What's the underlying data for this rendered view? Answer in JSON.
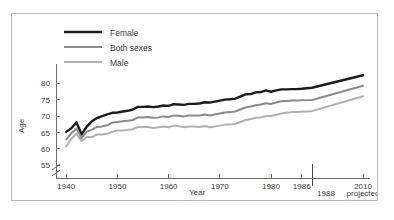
{
  "chart_data": {
    "type": "line",
    "title": "",
    "xlabel": "Year",
    "ylabel": "Age",
    "xlim": [
      1938,
      2013
    ],
    "ylim": [
      53,
      84
    ],
    "grid": false,
    "legend_position": "top-left",
    "y_ticks": [
      55,
      60,
      65,
      70,
      75,
      80
    ],
    "x_ticks": [
      1940,
      1950,
      1960,
      1970,
      1980,
      1986,
      2010
    ],
    "x_tick_labels": [
      "1940",
      "1950",
      "1960",
      "1970",
      "1980",
      "1986",
      "2010"
    ],
    "axis_break": true,
    "axis_break_note": "y-axis broken below 55",
    "annotations": [
      {
        "text": "1988",
        "x": 1988,
        "role": "projection-divider-label"
      },
      {
        "text": "projected",
        "x": 2010,
        "role": "projection-note"
      }
    ],
    "divider_x": 1988,
    "series": [
      {
        "name": "Female",
        "color": "#1c1c1c",
        "width": 2.4,
        "x": [
          1940,
          1941,
          1942,
          1943,
          1944,
          1945,
          1946,
          1947,
          1948,
          1949,
          1950,
          1951,
          1952,
          1953,
          1954,
          1955,
          1956,
          1957,
          1958,
          1959,
          1960,
          1961,
          1962,
          1963,
          1964,
          1965,
          1966,
          1967,
          1968,
          1969,
          1970,
          1971,
          1972,
          1973,
          1974,
          1975,
          1976,
          1977,
          1978,
          1979,
          1980,
          1981,
          1982,
          1983,
          1984,
          1985,
          1986,
          1988,
          2010
        ],
        "values": [
          65.2,
          66.3,
          68.1,
          64.4,
          66.8,
          68.4,
          69.4,
          70.0,
          70.5,
          71.0,
          71.1,
          71.4,
          71.6,
          72.0,
          72.8,
          72.8,
          72.9,
          72.7,
          72.9,
          73.2,
          73.1,
          73.6,
          73.5,
          73.4,
          73.7,
          73.7,
          73.8,
          74.2,
          74.1,
          74.4,
          74.7,
          75.0,
          75.1,
          75.3,
          75.9,
          76.6,
          76.7,
          77.2,
          77.3,
          77.8,
          77.4,
          77.8,
          78.1,
          78.1,
          78.2,
          78.2,
          78.3,
          78.6,
          82.4
        ]
      },
      {
        "name": "Both sexes",
        "color": "#8a8a8a",
        "width": 2.0,
        "x": [
          1940,
          1941,
          1942,
          1943,
          1944,
          1945,
          1946,
          1947,
          1948,
          1949,
          1950,
          1951,
          1952,
          1953,
          1954,
          1955,
          1956,
          1957,
          1958,
          1959,
          1960,
          1961,
          1962,
          1963,
          1964,
          1965,
          1966,
          1967,
          1968,
          1969,
          1970,
          1971,
          1972,
          1973,
          1974,
          1975,
          1976,
          1977,
          1978,
          1979,
          1980,
          1981,
          1982,
          1983,
          1984,
          1985,
          1986,
          1988,
          2010
        ],
        "values": [
          62.9,
          64.8,
          66.2,
          63.3,
          65.2,
          65.9,
          66.7,
          66.8,
          67.2,
          68.0,
          68.2,
          68.4,
          68.6,
          68.8,
          69.6,
          69.6,
          69.7,
          69.5,
          69.6,
          69.9,
          69.7,
          70.2,
          70.1,
          69.9,
          70.2,
          70.2,
          70.2,
          70.5,
          70.2,
          70.5,
          70.8,
          71.1,
          71.2,
          71.4,
          72.0,
          72.6,
          72.9,
          73.3,
          73.5,
          73.9,
          73.7,
          74.1,
          74.5,
          74.6,
          74.7,
          74.7,
          74.8,
          74.9,
          79.2
        ]
      },
      {
        "name": "Male",
        "color": "#b0b0b0",
        "width": 2.0,
        "x": [
          1940,
          1941,
          1942,
          1943,
          1944,
          1945,
          1946,
          1947,
          1948,
          1949,
          1950,
          1951,
          1952,
          1953,
          1954,
          1955,
          1956,
          1957,
          1958,
          1959,
          1960,
          1961,
          1962,
          1963,
          1964,
          1965,
          1966,
          1967,
          1968,
          1969,
          1970,
          1971,
          1972,
          1973,
          1974,
          1975,
          1976,
          1977,
          1978,
          1979,
          1980,
          1981,
          1982,
          1983,
          1984,
          1985,
          1986,
          1988,
          2010
        ],
        "values": [
          60.8,
          63.1,
          64.7,
          62.4,
          63.6,
          63.6,
          64.4,
          64.4,
          64.6,
          65.2,
          65.6,
          65.6,
          65.8,
          66.0,
          66.7,
          66.7,
          66.7,
          66.4,
          66.6,
          66.8,
          66.6,
          67.1,
          66.9,
          66.6,
          66.8,
          66.8,
          66.7,
          67.0,
          66.6,
          66.8,
          67.1,
          67.4,
          67.4,
          67.6,
          68.2,
          68.8,
          69.1,
          69.5,
          69.6,
          70.0,
          70.0,
          70.4,
          70.8,
          71.0,
          71.2,
          71.2,
          71.3,
          71.5,
          76.0
        ]
      }
    ]
  },
  "legend": {
    "items": [
      {
        "label": "Female"
      },
      {
        "label": "Both sexes"
      },
      {
        "label": "Male"
      }
    ]
  }
}
